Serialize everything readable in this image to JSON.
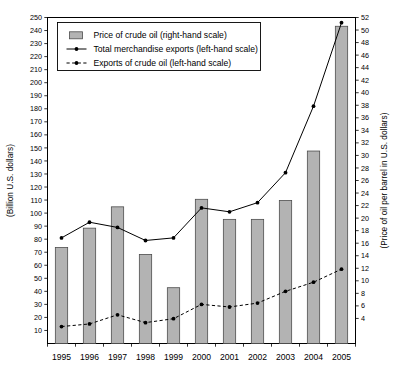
{
  "chart_data": {
    "type": "bar",
    "title": "",
    "subtitle": "",
    "xlabel": "",
    "ylabel": "(Billion U.S. dollars)",
    "y2label": "(Price of oil per barrel in U.S. dollars)",
    "categories": [
      "1995",
      "1996",
      "1997",
      "1998",
      "1999",
      "2000",
      "2001",
      "2002",
      "2003",
      "2004",
      "2005"
    ],
    "x": [
      1995,
      1996,
      1997,
      1998,
      1999,
      2000,
      2001,
      2002,
      2003,
      2004,
      2005
    ],
    "ylim": [
      0,
      250
    ],
    "y2lim": [
      0,
      52
    ],
    "yticks": [
      10,
      20,
      30,
      40,
      50,
      60,
      70,
      80,
      90,
      100,
      110,
      120,
      130,
      140,
      150,
      160,
      170,
      180,
      190,
      200,
      210,
      220,
      230,
      240,
      250
    ],
    "y2ticks": [
      4,
      6,
      8,
      10,
      12,
      14,
      16,
      18,
      20,
      22,
      24,
      26,
      28,
      30,
      32,
      34,
      36,
      38,
      40,
      42,
      44,
      46,
      48,
      50,
      52
    ],
    "grid": false,
    "legend_position": "upper-left",
    "series": [
      {
        "name": "Price of crude oil (right-hand scale)",
        "type": "bar",
        "axis": "right",
        "values": [
          15.3,
          18.4,
          21.8,
          14.2,
          8.9,
          23.0,
          19.8,
          19.8,
          22.8,
          30.7,
          50.6
        ]
      },
      {
        "name": "Total merchandise exports (left-hand scale)",
        "type": "line",
        "axis": "left",
        "style": "solid",
        "values": [
          81,
          93,
          89,
          79,
          81,
          104,
          101,
          108,
          131,
          182,
          246
        ]
      },
      {
        "name": "Exports of crude oil (left-hand scale)",
        "type": "line",
        "axis": "left",
        "style": "dashed",
        "values": [
          13,
          15,
          22,
          16,
          19,
          30,
          28,
          31,
          40,
          47,
          57
        ]
      }
    ]
  },
  "legend": {
    "items": [
      {
        "label": "Price of crude oil (right-hand scale)",
        "marker": "bar-swatch"
      },
      {
        "label": "Total merchandise exports (left-hand scale)",
        "marker": "solid-line-dot"
      },
      {
        "label": "Exports of crude oil (left-hand scale)",
        "marker": "dashed-line-dot"
      }
    ]
  }
}
